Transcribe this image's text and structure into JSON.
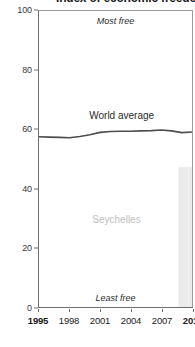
{
  "chart_data": {
    "type": "line",
    "title": "Index of economic freedom",
    "xlabel": "",
    "ylabel": "",
    "xlim": [
      1995,
      2010
    ],
    "ylim": [
      0,
      100
    ],
    "grid": false,
    "legend_position": "inline-labels",
    "x_ticks": [
      "1995",
      "1998",
      "2001",
      "2004",
      "2007",
      "2010"
    ],
    "x_tick_values": [
      1995,
      1998,
      2001,
      2004,
      2007,
      2010
    ],
    "y_ticks": [
      "0",
      "20",
      "40",
      "60",
      "80",
      "100"
    ],
    "y_tick_values": [
      0,
      20,
      40,
      60,
      80,
      100
    ],
    "annotations": [
      {
        "text": "Most free",
        "position": "top-center",
        "style": "italic"
      },
      {
        "text": "Least free",
        "position": "bottom-center",
        "style": "italic"
      },
      {
        "text": "World average",
        "position": "above-line",
        "style": "plain"
      },
      {
        "text": "Seychelles",
        "position": "mid-plot",
        "style": "muted"
      }
    ],
    "series": [
      {
        "name": "World average",
        "type": "line",
        "color": "#4d4d4d",
        "x": [
          1995,
          1996,
          1997,
          1998,
          1999,
          2000,
          2001,
          2002,
          2003,
          2004,
          2005,
          2006,
          2007,
          2008,
          2009,
          2010
        ],
        "values": [
          57.5,
          57.4,
          57.3,
          57.2,
          57.6,
          58.2,
          59.0,
          59.3,
          59.4,
          59.4,
          59.5,
          59.6,
          59.8,
          59.5,
          58.9,
          59.1
        ]
      },
      {
        "name": "Seychelles",
        "type": "bar",
        "color": "#ebebeb",
        "x": [
          2009,
          2010
        ],
        "values": [
          47.0,
          47.0
        ]
      }
    ]
  },
  "labels": {
    "most_free": "Most free",
    "least_free": "Least free",
    "world_average": "World average",
    "country": "Seychelles"
  },
  "colors": {
    "line": "#4d4d4d",
    "bar": "#ebebeb",
    "axis": "#6e6e6e",
    "text": "#1a1a1a",
    "muted_text": "#bdbdbd"
  }
}
